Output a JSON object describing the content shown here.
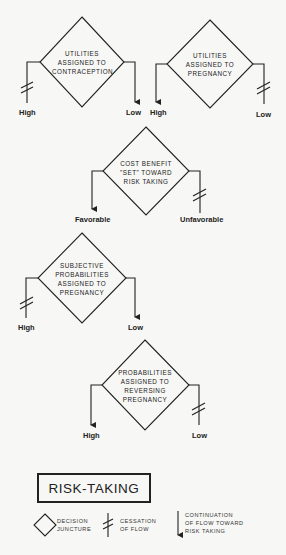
{
  "diagram": {
    "decisions": [
      {
        "id": "d1",
        "lines": [
          "UTILITIES",
          "ASSIGNED TO",
          "CONTRACEPTION"
        ],
        "left_label": "High",
        "right_label": "Low",
        "left_outcome": "cessation",
        "right_outcome": "continuation"
      },
      {
        "id": "d2",
        "lines": [
          "UTILITIES",
          "ASSIGNED TO",
          "PREGNANCY"
        ],
        "left_label": "High",
        "right_label": "Low",
        "left_outcome": "continuation",
        "right_outcome": "cessation"
      },
      {
        "id": "d3",
        "lines": [
          "COST BENEFIT",
          "\"SET\" TOWARD",
          "RISK TAKING"
        ],
        "left_label": "Favorable",
        "right_label": "Unfavorable",
        "left_outcome": "continuation",
        "right_outcome": "cessation"
      },
      {
        "id": "d4",
        "lines": [
          "SUBJECTIVE",
          "PROBABILITIES",
          "ASSIGNED TO",
          "PREGNANCY"
        ],
        "left_label": "High",
        "right_label": "Low",
        "left_outcome": "cessation",
        "right_outcome": "continuation"
      },
      {
        "id": "d5",
        "lines": [
          "PROBABILITIES",
          "ASSIGNED TO",
          "REVERSING",
          "PREGNANCY"
        ],
        "left_label": "High",
        "right_label": "Low",
        "left_outcome": "continuation",
        "right_outcome": "cessation"
      }
    ],
    "outcome_box": "RISK-TAKING",
    "legend": [
      {
        "icon": "diamond-icon",
        "lines": [
          "DECISION",
          "JUNCTURE"
        ]
      },
      {
        "icon": "cessation-icon",
        "lines": [
          "CESSATION",
          "OF FLOW"
        ]
      },
      {
        "icon": "down-arrow-icon",
        "lines": [
          "CONTINUATION",
          "OF FLOW TOWARD",
          "RISK TAKING"
        ]
      }
    ],
    "colors": {
      "ink": "#222222",
      "paper": "#f7f7f5"
    }
  }
}
